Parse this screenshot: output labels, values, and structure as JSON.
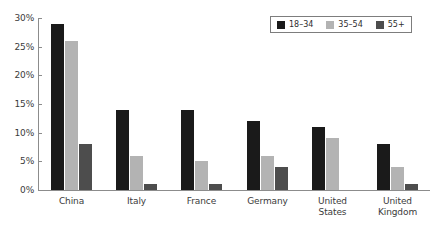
{
  "chart_data": {
    "type": "bar",
    "title": "",
    "subtitle": "",
    "xlabel": "",
    "ylabel": "",
    "categories": [
      "China",
      "Italy",
      "France",
      "Germany",
      "United States",
      "United Kingdom"
    ],
    "category_lines": [
      [
        "China"
      ],
      [
        "Italy"
      ],
      [
        "France"
      ],
      [
        "Germany"
      ],
      [
        "United",
        "States"
      ],
      [
        "United",
        "Kingdom"
      ]
    ],
    "series": [
      {
        "name": "18–34",
        "color": "#1a1a1a",
        "values": [
          29,
          14,
          14,
          12,
          11,
          8
        ]
      },
      {
        "name": "35–54",
        "color": "#b3b3b3",
        "values": [
          26,
          6,
          5,
          6,
          9,
          4
        ]
      },
      {
        "name": "55+",
        "color": "#4d4d4d",
        "values": [
          8,
          1,
          1,
          4,
          0,
          1
        ]
      }
    ],
    "ylim": [
      0,
      30
    ],
    "ytick_values": [
      0,
      5,
      10,
      15,
      20,
      25,
      30
    ],
    "ytick_labels": [
      "0%",
      "5%",
      "10%",
      "15%",
      "20%",
      "25%",
      "30%"
    ],
    "grid": false,
    "legend_position": "top-right",
    "value_suffix": "%"
  },
  "axis": {
    "line_color": "#8c8c8c",
    "tick_color": "#8c8c8c",
    "label_color": "#3b3b3b"
  },
  "legend": {
    "border_color": "#7d7d7d",
    "background": "#ffffff"
  }
}
